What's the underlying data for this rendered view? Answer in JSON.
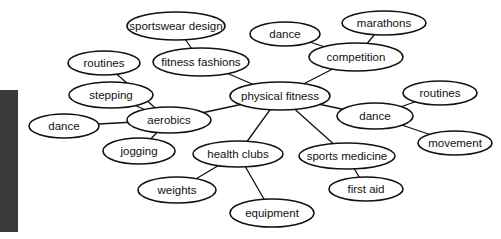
{
  "diagram": {
    "type": "mind-map",
    "center": "physical fitness",
    "nodes": [
      {
        "id": "physical_fitness",
        "label": "physical fitness",
        "cx": 280,
        "cy": 96,
        "rx": 50,
        "ry": 14
      },
      {
        "id": "fitness_fashions",
        "label": "fitness fashions",
        "cx": 201,
        "cy": 62,
        "rx": 48,
        "ry": 14
      },
      {
        "id": "sportswear_design",
        "label": "sportswear design",
        "cx": 176,
        "cy": 26,
        "rx": 49,
        "ry": 14
      },
      {
        "id": "competition",
        "label": "competition",
        "cx": 356,
        "cy": 57,
        "rx": 47,
        "ry": 14
      },
      {
        "id": "dance_top",
        "label": "dance",
        "cx": 285,
        "cy": 34,
        "rx": 35,
        "ry": 12
      },
      {
        "id": "marathons",
        "label": "marathons",
        "cx": 384,
        "cy": 23,
        "rx": 42,
        "ry": 12
      },
      {
        "id": "aerobics",
        "label": "aerobics",
        "cx": 169,
        "cy": 120,
        "rx": 42,
        "ry": 13
      },
      {
        "id": "routines_left",
        "label": "routines",
        "cx": 104,
        "cy": 63,
        "rx": 36,
        "ry": 12
      },
      {
        "id": "stepping",
        "label": "stepping",
        "cx": 111,
        "cy": 95,
        "rx": 42,
        "ry": 13
      },
      {
        "id": "dance_left",
        "label": "dance",
        "cx": 64,
        "cy": 126,
        "rx": 35,
        "ry": 12
      },
      {
        "id": "jogging",
        "label": "jogging",
        "cx": 139,
        "cy": 151,
        "rx": 36,
        "ry": 13
      },
      {
        "id": "dance_right",
        "label": "dance",
        "cx": 375,
        "cy": 116,
        "rx": 38,
        "ry": 13
      },
      {
        "id": "routines_right",
        "label": "routines",
        "cx": 440,
        "cy": 93,
        "rx": 37,
        "ry": 12
      },
      {
        "id": "movement",
        "label": "movement",
        "cx": 455,
        "cy": 143,
        "rx": 37,
        "ry": 12
      },
      {
        "id": "health_clubs",
        "label": "health clubs",
        "cx": 238,
        "cy": 154,
        "rx": 45,
        "ry": 13
      },
      {
        "id": "weights",
        "label": "weights",
        "cx": 177,
        "cy": 190,
        "rx": 39,
        "ry": 13
      },
      {
        "id": "equipment",
        "label": "equipment",
        "cx": 272,
        "cy": 213,
        "rx": 42,
        "ry": 14
      },
      {
        "id": "sports_medicine",
        "label": "sports medicine",
        "cx": 347,
        "cy": 156,
        "rx": 48,
        "ry": 13
      },
      {
        "id": "first_aid",
        "label": "first aid",
        "cx": 366,
        "cy": 189,
        "rx": 37,
        "ry": 12
      }
    ],
    "edges": [
      [
        "physical_fitness",
        "fitness_fashions"
      ],
      [
        "fitness_fashions",
        "sportswear_design"
      ],
      [
        "physical_fitness",
        "competition"
      ],
      [
        "competition",
        "dance_top"
      ],
      [
        "competition",
        "marathons"
      ],
      [
        "physical_fitness",
        "aerobics"
      ],
      [
        "aerobics",
        "routines_left"
      ],
      [
        "aerobics",
        "stepping"
      ],
      [
        "aerobics",
        "dance_left"
      ],
      [
        "aerobics",
        "jogging"
      ],
      [
        "physical_fitness",
        "dance_right"
      ],
      [
        "dance_right",
        "routines_right"
      ],
      [
        "dance_right",
        "movement"
      ],
      [
        "physical_fitness",
        "health_clubs"
      ],
      [
        "health_clubs",
        "weights"
      ],
      [
        "health_clubs",
        "equipment"
      ],
      [
        "physical_fitness",
        "sports_medicine"
      ],
      [
        "sports_medicine",
        "first_aid"
      ]
    ]
  },
  "colors": {
    "stroke": "#111111",
    "background": "#ffffff",
    "side_block": "#3a3a3a"
  }
}
